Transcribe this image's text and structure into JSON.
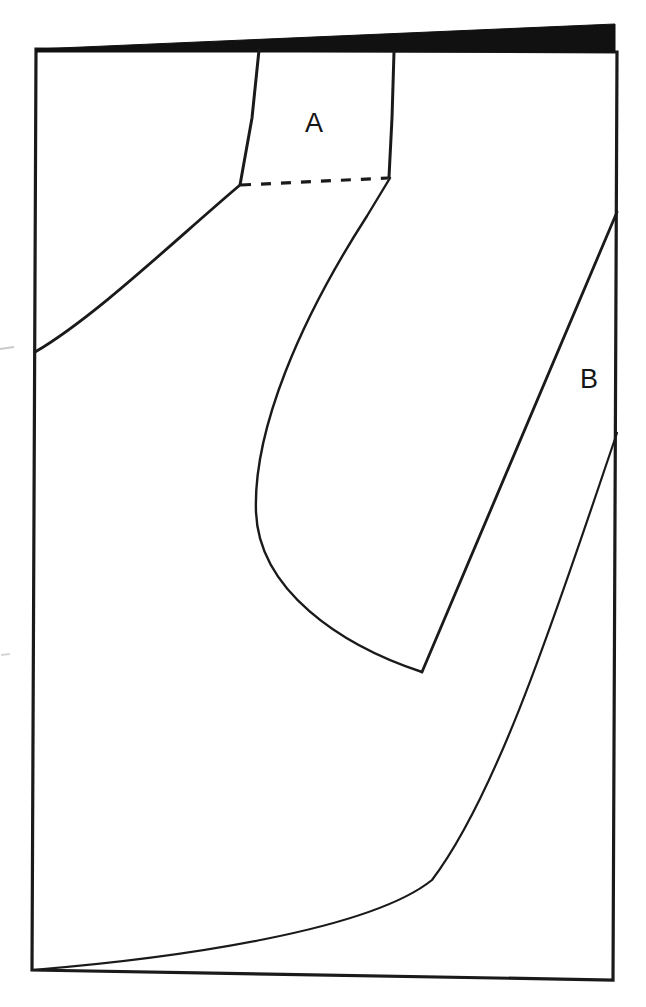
{
  "figure": {
    "background_color": "#ffffff",
    "stroke_color": "#1a1a1a",
    "fill_color": "#111111",
    "canvas": {
      "width": 646,
      "height": 1007
    },
    "labels": [
      {
        "id": "A",
        "text": "A",
        "x": 316,
        "y": 125
      },
      {
        "id": "B",
        "text": "B",
        "x": 590,
        "y": 380
      }
    ],
    "shapes": {
      "page_outline": {
        "name": "page-outline",
        "kind": "polygon",
        "points": "36,49 617,52 613,980 32,970"
      },
      "top_black_wedge": {
        "name": "top-black-wedge",
        "kind": "polygon",
        "fill": "#111111",
        "points": "36,49 615,24 615,52 36,52"
      },
      "region_a_left_edge": {
        "name": "region-a-left-edge",
        "kind": "path",
        "d": "M 259,50 L 252,118 L 240,185"
      },
      "region_a_right_edge": {
        "name": "region-a-right-edge",
        "kind": "path",
        "d": "M 394,52 L 392,118 L 389,177"
      },
      "region_a_dashed_base": {
        "name": "region-a-dashed-base",
        "kind": "line",
        "dash": "10 10",
        "x1": 241,
        "y1": 185,
        "x2": 388,
        "y2": 178
      },
      "left_sweep_curve": {
        "name": "left-sweep-curve",
        "kind": "path",
        "d": "M 35,352 C 95,317 175,240 240,185"
      },
      "central_lobe_curve": {
        "name": "central-lobe-curve",
        "kind": "path",
        "d": "M 390,178 L 367,216 C 300,320 253,430 256,512 C 259,590 340,645 422,672"
      },
      "region_b_upper_line": {
        "name": "region-b-upper-line",
        "kind": "line",
        "x1": 617,
        "y1": 212,
        "x2": 422,
        "y2": 672
      },
      "region_b_lower_curve": {
        "name": "region-b-lower-curve",
        "kind": "path",
        "d": "M 617,433 C 560,600 500,790 432,880 C 370,930 180,958 32,970"
      }
    }
  }
}
